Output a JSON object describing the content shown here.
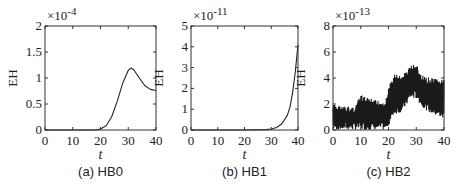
{
  "chart_data": [
    {
      "type": "line",
      "caption": "(a) HB0",
      "xlabel": "t",
      "ylabel": "EH",
      "multiplier": "×10",
      "exponent": "-4",
      "xlim": [
        0,
        40
      ],
      "ylim": [
        0,
        2
      ],
      "xticks": [
        "0",
        "10",
        "20",
        "30",
        "40"
      ],
      "yticks": [
        "0",
        "0.5",
        "1",
        "1.5",
        "2"
      ],
      "x": [
        0,
        10,
        18,
        20,
        22,
        24,
        26,
        28,
        30,
        31,
        32,
        34,
        36,
        38,
        40
      ],
      "y": [
        0,
        0,
        0.0,
        0.02,
        0.08,
        0.25,
        0.55,
        0.9,
        1.15,
        1.19,
        1.16,
        1.0,
        0.85,
        0.78,
        0.76
      ]
    },
    {
      "type": "line",
      "caption": "(b) HB1",
      "xlabel": "t",
      "ylabel": "EH",
      "multiplier": "×10",
      "exponent": "-11",
      "xlim": [
        0,
        40
      ],
      "ylim": [
        0,
        5
      ],
      "xticks": [
        "0",
        "10",
        "20",
        "30",
        "40"
      ],
      "yticks": [
        "0",
        "1",
        "2",
        "3",
        "4",
        "5"
      ],
      "x": [
        0,
        10,
        20,
        28,
        30,
        32,
        34,
        36,
        37,
        38,
        39,
        40
      ],
      "y": [
        0,
        0,
        0,
        0.02,
        0.05,
        0.12,
        0.3,
        0.7,
        1.1,
        1.8,
        2.8,
        4.1
      ]
    },
    {
      "type": "line",
      "caption": "(c) HB2",
      "xlabel": "t",
      "ylabel": "EH",
      "multiplier": "×10",
      "exponent": "-13",
      "xlim": [
        0,
        40
      ],
      "ylim": [
        0,
        8
      ],
      "xticks": [
        "0",
        "10",
        "20",
        "30",
        "40"
      ],
      "yticks": [
        "0",
        "2",
        "4",
        "6",
        "8"
      ],
      "note": "noisy oscillating signal; envelope bounds shown",
      "x": [
        0,
        5,
        8,
        10,
        15,
        19,
        20,
        22,
        25,
        28,
        30,
        32,
        35,
        40
      ],
      "upper": [
        2.0,
        1.8,
        1.9,
        2.7,
        2.3,
        2.3,
        3.3,
        4.3,
        4.2,
        5.0,
        5.1,
        4.2,
        4.0,
        3.9
      ],
      "lower": [
        0,
        0,
        0,
        0,
        0,
        0,
        0.3,
        1.2,
        1.4,
        2.4,
        2.4,
        1.8,
        1.3,
        0.8
      ]
    }
  ]
}
